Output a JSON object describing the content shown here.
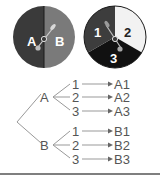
{
  "spinners": [
    {
      "name": "spinner-ab",
      "sections": [
        {
          "label": "A",
          "color": "#3a3a3a",
          "text_color": "#ffffff"
        },
        {
          "label": "B",
          "color": "#7a7a7a",
          "text_color": "#ffffff"
        }
      ]
    },
    {
      "name": "spinner-123",
      "sections": [
        {
          "label": "1",
          "color": "#3d3d3d",
          "text_color": "#ffffff"
        },
        {
          "label": "2",
          "color": "#f2f2f2",
          "text_color": "#222222"
        },
        {
          "label": "3",
          "color": "#111111",
          "text_color": "#ffffff"
        }
      ]
    }
  ],
  "tree": {
    "branches": [
      {
        "label": "A",
        "children": [
          "1",
          "2",
          "3"
        ],
        "outcomes": [
          "A1",
          "A2",
          "A3"
        ]
      },
      {
        "label": "B",
        "children": [
          "1",
          "2",
          "3"
        ],
        "outcomes": [
          "B1",
          "B2",
          "B3"
        ]
      }
    ],
    "line_color": "#999999",
    "text_color": "#555555"
  }
}
